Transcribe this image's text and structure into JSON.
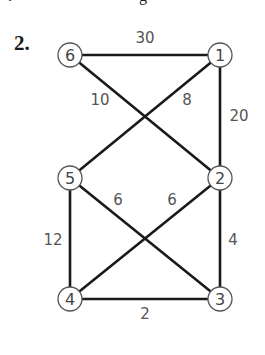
{
  "problem": {
    "number_label": "2."
  },
  "clipped_fragments": [
    {
      "text": ".",
      "x": 8
    },
    {
      "text": "g",
      "x": 139
    }
  ],
  "graph": {
    "directed": false,
    "nodes": [
      {
        "id": "1",
        "label": "1",
        "x": 220,
        "y": 55
      },
      {
        "id": "2",
        "label": "2",
        "x": 220,
        "y": 178
      },
      {
        "id": "3",
        "label": "3",
        "x": 220,
        "y": 299
      },
      {
        "id": "4",
        "label": "4",
        "x": 70,
        "y": 299
      },
      {
        "id": "5",
        "label": "5",
        "x": 70,
        "y": 178
      },
      {
        "id": "6",
        "label": "6",
        "x": 70,
        "y": 55
      }
    ],
    "edges": [
      {
        "from": "6",
        "to": "1",
        "weight": "30",
        "label_x": 145,
        "label_y": 38
      },
      {
        "from": "6",
        "to": "2",
        "weight": "10",
        "label_x": 100,
        "label_y": 100
      },
      {
        "from": "1",
        "to": "5",
        "weight": "8",
        "label_x": 187,
        "label_y": 100
      },
      {
        "from": "1",
        "to": "2",
        "weight": "20",
        "label_x": 239,
        "label_y": 116
      },
      {
        "from": "5",
        "to": "3",
        "weight": "6",
        "label_x": 118,
        "label_y": 200
      },
      {
        "from": "2",
        "to": "4",
        "weight": "6",
        "label_x": 172,
        "label_y": 200
      },
      {
        "from": "5",
        "to": "4",
        "weight": "12",
        "label_x": 53,
        "label_y": 240
      },
      {
        "from": "2",
        "to": "3",
        "weight": "4",
        "label_x": 233,
        "label_y": 240
      },
      {
        "from": "4",
        "to": "3",
        "weight": "2",
        "label_x": 145,
        "label_y": 314
      }
    ]
  }
}
